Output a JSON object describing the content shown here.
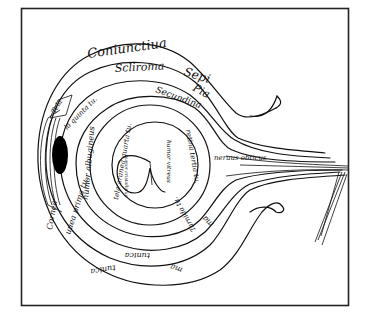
{
  "figure": {
    "type": "medieval anatomical diagram of the eye",
    "frame": {
      "border_color": "#222222",
      "background": "#ffffff"
    },
    "colors": {
      "ink": "#111111",
      "pupil": "#000000"
    },
    "labels": {
      "outer_top": "Coniunctiua",
      "outer_top_right": "Sepi",
      "second_top": "Scliroma",
      "second_top_right": "Pia",
      "third_top": "Secundina",
      "cornea_top": "Tela",
      "inner_left_top": "la quinta tu.",
      "humor_albugineus": "humor albugineus",
      "aranea": "tela aranea quarta tu.",
      "humor_vitreus": "humor vitreus",
      "lens": "humor cristallinus",
      "retina": "retina tertia tu.",
      "nerve": "neruus obticus",
      "cornea_bottom": "Cornea",
      "uvea": "uuea prima tu.",
      "bottom_inner": "tunica",
      "bottom_outer": "tunica",
      "bottom_right_outer": "ma",
      "bottom_right_mid": "ma",
      "bottom_right_inner": "Tarnida tu."
    }
  }
}
